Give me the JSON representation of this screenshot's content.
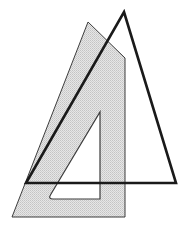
{
  "figure": {
    "canvas": {
      "width": 189,
      "height": 230,
      "background": "#ffffff"
    },
    "colors": {
      "outline_dark": "#1a1a1a",
      "outline_thin": "#3c3c3c",
      "hatch_fill": "#d9d9d9",
      "hatch_line": "#b4b4b4",
      "background": "#ffffff"
    },
    "shapes": [
      {
        "name": "shaded-set-square",
        "type": "polygon",
        "fill": "hatched",
        "stroke": "#3c3c3c",
        "stroke_width": 1,
        "points": "88,22 125,58 125,217 12,217"
      },
      {
        "name": "inner-cutout-triangle",
        "type": "polygon",
        "fill": "#ffffff",
        "stroke": "#3c3c3c",
        "stroke_width": 1.2,
        "points": "100,112 100,199 48,199"
      },
      {
        "name": "dark-triangle",
        "type": "polygon",
        "fill": "none",
        "stroke": "#1a1a1a",
        "stroke_width": 2.6,
        "points": "124,12 176,183 26,183"
      }
    ],
    "labels": []
  }
}
